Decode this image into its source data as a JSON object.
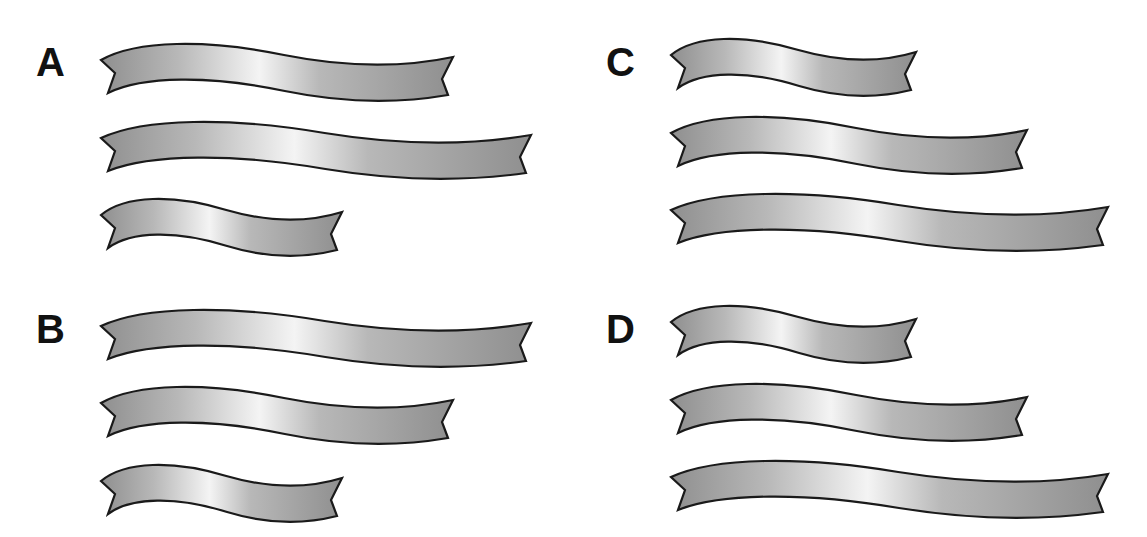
{
  "figure": {
    "colors": {
      "background": "#ffffff",
      "label": "#111111",
      "ribbon_outline": "#1a1a1a",
      "ribbon_dark": "#8f8f8f",
      "ribbon_mid": "#b8b8b8",
      "ribbon_light": "#f4f4f4"
    },
    "ribbon_lengths": {
      "short": "short",
      "medium": "medium",
      "long": "long"
    }
  },
  "options": [
    {
      "label": "A",
      "label_pos": {
        "x": 36,
        "y": 42
      },
      "ribbons": [
        {
          "size": "medium",
          "x0": 101,
          "x1": 453,
          "y0": 60
        },
        {
          "size": "long",
          "x0": 101,
          "x1": 531,
          "y0": 138
        },
        {
          "size": "short",
          "x0": 101,
          "x1": 342,
          "y0": 215
        }
      ]
    },
    {
      "label": "B",
      "label_pos": {
        "x": 36,
        "y": 309
      },
      "ribbons": [
        {
          "size": "long",
          "x0": 101,
          "x1": 531,
          "y0": 326
        },
        {
          "size": "medium",
          "x0": 101,
          "x1": 453,
          "y0": 403
        },
        {
          "size": "short",
          "x0": 101,
          "x1": 342,
          "y0": 481
        }
      ]
    },
    {
      "label": "C",
      "label_pos": {
        "x": 606,
        "y": 42
      },
      "ribbons": [
        {
          "size": "short",
          "x0": 671,
          "x1": 916,
          "y0": 55
        },
        {
          "size": "medium",
          "x0": 671,
          "x1": 1027,
          "y0": 133
        },
        {
          "size": "long",
          "x0": 671,
          "x1": 1108,
          "y0": 210
        }
      ]
    },
    {
      "label": "D",
      "label_pos": {
        "x": 606,
        "y": 309
      },
      "ribbons": [
        {
          "size": "short",
          "x0": 671,
          "x1": 916,
          "y0": 322
        },
        {
          "size": "medium",
          "x0": 671,
          "x1": 1027,
          "y0": 400
        },
        {
          "size": "long",
          "x0": 671,
          "x1": 1108,
          "y0": 477
        }
      ]
    }
  ]
}
